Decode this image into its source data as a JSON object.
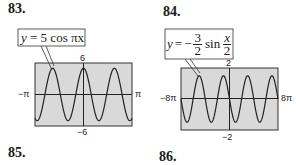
{
  "exercises": [
    {
      "number": "83.",
      "equation": "y = 5 cos πx",
      "window": {
        "xmin": "−π",
        "xmax": "π",
        "ymax": "6",
        "ymin": "−6"
      }
    },
    {
      "number": "84.",
      "equation_prefix": "y = −",
      "equation_frac_num": "3",
      "equation_frac_den": "2",
      "equation_fn": "sin",
      "equation_arg_num": "x",
      "equation_arg_den": "2",
      "window": {
        "xmin": "−8π",
        "xmax": "8π",
        "ymax": "2",
        "ymin": "−2"
      }
    }
  ],
  "next_numbers": [
    "85.",
    "86."
  ],
  "chart_data": [
    {
      "type": "line",
      "title": "y = 5 cos πx",
      "function": "5*cos(pi*x)",
      "xlim": [
        "-pi",
        "pi"
      ],
      "ylim": [
        -6,
        6
      ],
      "tick_labels": {
        "x": [
          "−π",
          "π"
        ],
        "y": [
          "6",
          "−6"
        ]
      },
      "amplitude": 5,
      "period": 2,
      "grid": false,
      "background": "#d9d9d9"
    },
    {
      "type": "line",
      "title": "y = −(3/2) sin(x/2)",
      "function": "-1.5*sin(x/2)",
      "xlim": [
        "-8pi",
        "8pi"
      ],
      "ylim": [
        -2,
        2
      ],
      "tick_labels": {
        "x": [
          "−8π",
          "8π"
        ],
        "y": [
          "2",
          "−2"
        ]
      },
      "amplitude": 1.5,
      "period": "4π",
      "grid": false,
      "background": "#d9d9d9"
    }
  ]
}
